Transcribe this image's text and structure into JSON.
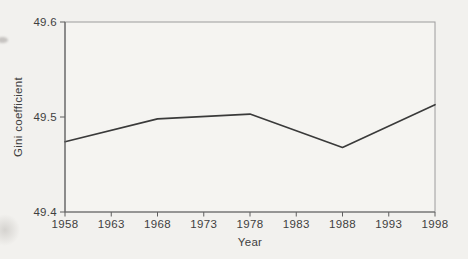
{
  "figure": {
    "background_color": "#f2f1ee",
    "plot_fill": "#f5f4f1",
    "border_color": "#9c9c9c",
    "axis_color": "#646464",
    "tick_color": "#5e5e5e",
    "line_color": "#3a3a3a",
    "label_color": "#3f3f3f"
  },
  "chart_data": {
    "type": "line",
    "xlabel": "Year",
    "ylabel": "Gini coefficient",
    "x": [
      1958,
      1968,
      1978,
      1988,
      1998
    ],
    "y": [
      49.474,
      49.498,
      49.503,
      49.468,
      49.513
    ],
    "xlim": [
      1958,
      1998
    ],
    "ylim": [
      49.4,
      49.6
    ],
    "xticks": [
      1958,
      1963,
      1968,
      1973,
      1978,
      1983,
      1988,
      1993,
      1998
    ],
    "yticks": [
      49.4,
      49.5,
      49.6
    ],
    "ytick_labels": [
      "49.4",
      "49.5",
      "49.6"
    ],
    "grid": false,
    "legend_position": "none"
  }
}
